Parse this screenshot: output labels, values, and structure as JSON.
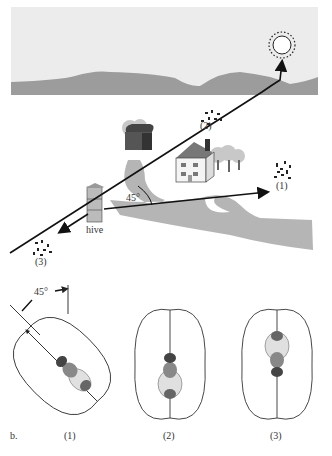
{
  "figure": {
    "panel_a": {
      "labels": {
        "hive": "hive",
        "angle": "45°",
        "food_1": "(1)",
        "food_2": "(2)",
        "food_3": "(3)"
      },
      "objects": [
        "sun",
        "hills",
        "barn",
        "house",
        "trees",
        "hive",
        "flower-patch-1",
        "flower-patch-2",
        "flower-patch-3",
        "road"
      ]
    },
    "panel_b": {
      "panel_letter": "b.",
      "angle_label": "45°",
      "dances": [
        {
          "label": "(1)",
          "orientation_deg": -45
        },
        {
          "label": "(2)",
          "orientation_deg": 0
        },
        {
          "label": "(3)",
          "orientation_deg": 180
        }
      ]
    },
    "colors": {
      "sky": "#ececec",
      "hills": "#9a9a9a",
      "road": "#b0b0b0",
      "line": "#111111",
      "label": "#333333"
    }
  }
}
